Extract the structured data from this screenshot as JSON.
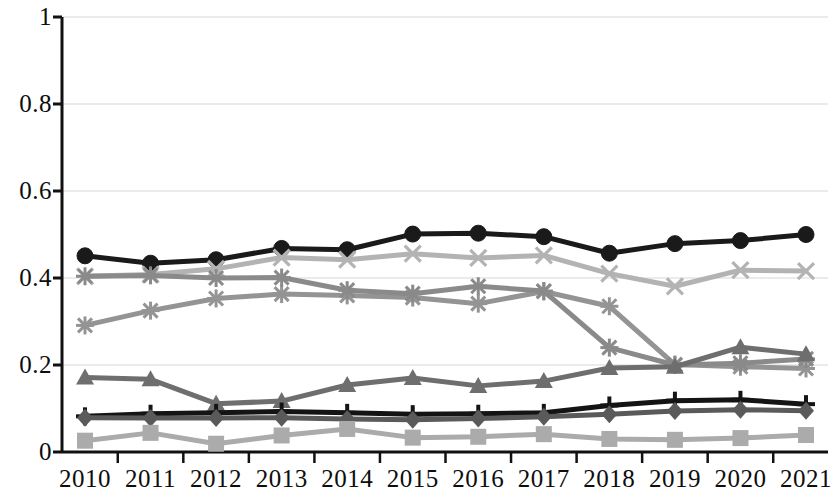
{
  "chart_data": {
    "type": "line",
    "title": "",
    "xlabel": "",
    "ylabel": "",
    "x": [
      "2010",
      "2011",
      "2012",
      "2013",
      "2014",
      "2015",
      "2016",
      "2017",
      "2018",
      "2019",
      "2020",
      "2021"
    ],
    "xtick_labels": [
      "2010",
      "2011",
      "2012",
      "2013",
      "2014",
      "2015",
      "2016",
      "2017",
      "2018",
      "2019",
      "2020",
      "2021"
    ],
    "ytick_labels": [
      "0",
      "0.2",
      "0.4",
      "0.6",
      "0.8",
      "1"
    ],
    "ytick_values": [
      0,
      0.2,
      0.4,
      0.6,
      0.8,
      1
    ],
    "ylim": [
      0,
      1
    ],
    "grid": true,
    "grid_orientation": "horizontal",
    "legend": "none",
    "series": [
      {
        "name": "series-1-circle",
        "marker": "circle",
        "color": "#1a1a1a",
        "values": [
          0.451,
          0.434,
          0.442,
          0.468,
          0.465,
          0.501,
          0.503,
          0.495,
          0.457,
          0.479,
          0.486,
          0.5
        ]
      },
      {
        "name": "series-2-x",
        "marker": "x",
        "color": "#b3b3b3",
        "values": [
          0.404,
          0.408,
          0.421,
          0.447,
          0.442,
          0.456,
          0.446,
          0.452,
          0.41,
          0.381,
          0.418,
          0.416
        ]
      },
      {
        "name": "series-3-asterisk-light",
        "marker": "asterisk",
        "color": "#949494",
        "values": [
          0.291,
          0.325,
          0.353,
          0.363,
          0.36,
          0.355,
          0.341,
          0.369,
          0.335,
          0.201,
          0.196,
          0.192
        ]
      },
      {
        "name": "series-4-asterisk-dark",
        "marker": "asterisk",
        "color": "#8a8a8a",
        "values": [
          0.404,
          0.406,
          0.4,
          0.401,
          0.372,
          0.364,
          0.381,
          0.37,
          0.24,
          0.2,
          0.204,
          0.214
        ]
      },
      {
        "name": "series-5-triangle",
        "marker": "triangle",
        "color": "#6e6e6e",
        "values": [
          0.171,
          0.167,
          0.111,
          0.117,
          0.154,
          0.17,
          0.152,
          0.163,
          0.193,
          0.196,
          0.241,
          0.225
        ]
      },
      {
        "name": "series-6-plus",
        "marker": "plus",
        "color": "#141414",
        "values": [
          0.082,
          0.088,
          0.09,
          0.093,
          0.09,
          0.087,
          0.088,
          0.09,
          0.107,
          0.118,
          0.12,
          0.11
        ]
      },
      {
        "name": "series-7-diamond",
        "marker": "diamond",
        "color": "#5a5a5a",
        "values": [
          0.079,
          0.078,
          0.078,
          0.079,
          0.076,
          0.074,
          0.077,
          0.081,
          0.087,
          0.094,
          0.097,
          0.095
        ]
      },
      {
        "name": "series-8-square",
        "marker": "square",
        "color": "#ababab",
        "values": [
          0.026,
          0.044,
          0.019,
          0.038,
          0.053,
          0.033,
          0.035,
          0.041,
          0.03,
          0.028,
          0.032,
          0.039
        ]
      }
    ]
  },
  "axes": {
    "axis_color": "#111111",
    "grid_color": "#d8d8d8"
  }
}
